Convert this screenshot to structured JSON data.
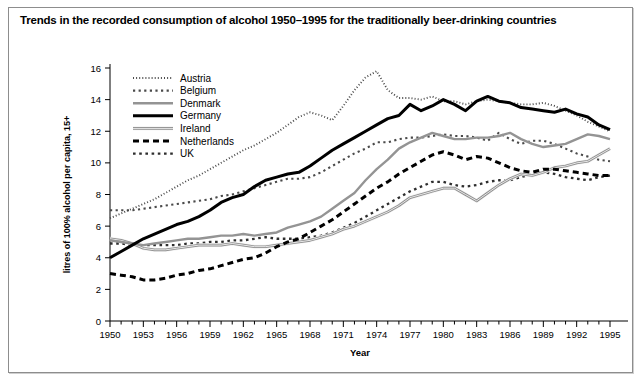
{
  "figure": {
    "title": "Trends in the recorded consumption of alcohol 1950–1995 for the traditionally beer-drinking countries",
    "frame_border_color": "#8d8d8d"
  },
  "axes": {
    "x_title": "Year",
    "y_title": "litres of 100% alcohol per capita, 15+",
    "x_tick_labels": [
      "1950",
      "1953",
      "1956",
      "1959",
      "1962",
      "1965",
      "1968",
      "1971",
      "1974",
      "1977",
      "1980",
      "1983",
      "1986",
      "1989",
      "1992",
      "1995"
    ],
    "y_tick_labels": [
      "0",
      "2",
      "4",
      "6",
      "8",
      "10",
      "12",
      "14",
      "16"
    ]
  },
  "legend": {
    "items": [
      {
        "label": "Austria",
        "style": "fine-dotted",
        "color": "#555555"
      },
      {
        "label": "Belgium",
        "style": "circle-dotted",
        "color": "#555555"
      },
      {
        "label": "Denmark",
        "style": "solid-grey",
        "color": "#8a8a8a"
      },
      {
        "label": "Germany",
        "style": "solid-thick",
        "color": "#000000"
      },
      {
        "label": "Ireland",
        "style": "double-grey",
        "color": "#8a8a8a"
      },
      {
        "label": "Netherlands",
        "style": "dashed-thick",
        "color": "#000000"
      },
      {
        "label": "UK",
        "style": "coarse-dotted",
        "color": "#3a3a3a"
      }
    ]
  },
  "chart_data": {
    "type": "line",
    "title": "Trends in the recorded consumption of alcohol 1950–1995 for the traditionally beer-drinking countries",
    "xlabel": "Year",
    "ylabel": "litres of 100% alcohol per capita, 15+",
    "xlim": [
      1950,
      1995
    ],
    "ylim": [
      0,
      16
    ],
    "grid": false,
    "legend_position": "upper-left-inside",
    "x": [
      1950,
      1951,
      1952,
      1953,
      1954,
      1955,
      1956,
      1957,
      1958,
      1959,
      1960,
      1961,
      1962,
      1963,
      1964,
      1965,
      1966,
      1967,
      1968,
      1969,
      1970,
      1971,
      1972,
      1973,
      1974,
      1975,
      1976,
      1977,
      1978,
      1979,
      1980,
      1981,
      1982,
      1983,
      1984,
      1985,
      1986,
      1987,
      1988,
      1989,
      1990,
      1991,
      1992,
      1993,
      1994,
      1995
    ],
    "series": [
      {
        "name": "Austria",
        "values": [
          6.5,
          6.8,
          7.1,
          7.4,
          7.7,
          8.1,
          8.5,
          8.9,
          9.2,
          9.6,
          10.0,
          10.4,
          10.8,
          11.1,
          11.5,
          11.9,
          12.4,
          12.9,
          13.2,
          13.0,
          12.7,
          13.6,
          14.6,
          15.4,
          15.8,
          14.6,
          14.1,
          14.1,
          14.0,
          14.2,
          13.9,
          13.9,
          13.7,
          13.9,
          14.0,
          13.9,
          13.8,
          13.7,
          13.7,
          13.8,
          13.6,
          13.3,
          13.0,
          12.6,
          12.3,
          12.0
        ]
      },
      {
        "name": "Belgium",
        "values": [
          7.0,
          7.0,
          7.0,
          7.1,
          7.2,
          7.3,
          7.4,
          7.5,
          7.6,
          7.7,
          7.9,
          8.0,
          8.2,
          8.4,
          8.6,
          8.8,
          9.0,
          9.0,
          9.1,
          9.4,
          9.8,
          10.2,
          10.6,
          10.9,
          11.3,
          11.3,
          11.5,
          11.6,
          11.6,
          11.7,
          11.8,
          11.7,
          11.7,
          11.6,
          11.4,
          11.9,
          11.5,
          11.2,
          11.4,
          11.4,
          11.2,
          10.9,
          10.6,
          10.4,
          10.2,
          10.1
        ]
      },
      {
        "name": "Denmark",
        "values": [
          5.1,
          5.0,
          4.9,
          4.8,
          4.9,
          5.0,
          5.1,
          5.2,
          5.2,
          5.3,
          5.4,
          5.4,
          5.5,
          5.4,
          5.5,
          5.6,
          5.9,
          6.1,
          6.3,
          6.6,
          7.1,
          7.6,
          8.1,
          8.9,
          9.6,
          10.2,
          10.9,
          11.3,
          11.6,
          11.9,
          11.7,
          11.5,
          11.5,
          11.6,
          11.6,
          11.7,
          11.9,
          11.5,
          11.2,
          11.0,
          11.1,
          11.2,
          11.5,
          11.8,
          11.7,
          11.5
        ]
      },
      {
        "name": "Germany",
        "values": [
          4.0,
          4.4,
          4.8,
          5.2,
          5.5,
          5.8,
          6.1,
          6.3,
          6.6,
          7.0,
          7.5,
          7.8,
          8.0,
          8.5,
          8.9,
          9.1,
          9.3,
          9.4,
          9.8,
          10.3,
          10.8,
          11.2,
          11.6,
          12.0,
          12.4,
          12.8,
          13.0,
          13.7,
          13.3,
          13.6,
          14.0,
          13.7,
          13.3,
          13.9,
          14.2,
          13.9,
          13.8,
          13.5,
          13.4,
          13.3,
          13.2,
          13.4,
          13.1,
          12.9,
          12.4,
          12.1
        ]
      },
      {
        "name": "Ireland",
        "values": [
          5.2,
          5.1,
          4.9,
          4.6,
          4.5,
          4.5,
          4.6,
          4.7,
          4.8,
          4.8,
          4.8,
          4.9,
          4.8,
          4.7,
          4.7,
          4.8,
          4.9,
          5.0,
          5.1,
          5.3,
          5.5,
          5.8,
          6.0,
          6.3,
          6.6,
          6.9,
          7.3,
          7.8,
          8.0,
          8.2,
          8.4,
          8.4,
          8.0,
          7.6,
          8.1,
          8.6,
          9.0,
          9.3,
          9.2,
          9.4,
          9.7,
          9.8,
          10.0,
          10.1,
          10.5,
          10.9
        ]
      },
      {
        "name": "Netherlands",
        "values": [
          3.0,
          2.9,
          2.8,
          2.6,
          2.6,
          2.7,
          2.9,
          3.0,
          3.2,
          3.3,
          3.5,
          3.7,
          3.9,
          4.0,
          4.3,
          4.7,
          5.0,
          5.2,
          5.6,
          6.0,
          6.4,
          6.9,
          7.4,
          7.9,
          8.4,
          8.8,
          9.3,
          9.7,
          10.1,
          10.5,
          10.7,
          10.5,
          10.2,
          10.4,
          10.3,
          10.0,
          9.7,
          9.5,
          9.4,
          9.6,
          9.6,
          9.5,
          9.4,
          9.3,
          9.2,
          9.2
        ]
      },
      {
        "name": "UK",
        "values": [
          4.9,
          4.9,
          4.8,
          4.8,
          4.8,
          4.8,
          4.8,
          4.9,
          4.9,
          5.0,
          5.0,
          5.1,
          5.1,
          5.2,
          5.3,
          5.2,
          5.2,
          5.2,
          5.3,
          5.4,
          5.6,
          5.9,
          6.2,
          6.6,
          7.0,
          7.4,
          7.8,
          8.2,
          8.5,
          8.8,
          8.8,
          8.6,
          8.5,
          8.6,
          8.8,
          8.9,
          8.9,
          9.1,
          9.3,
          9.4,
          9.3,
          9.1,
          9.0,
          8.9,
          9.1,
          9.2
        ]
      }
    ]
  }
}
